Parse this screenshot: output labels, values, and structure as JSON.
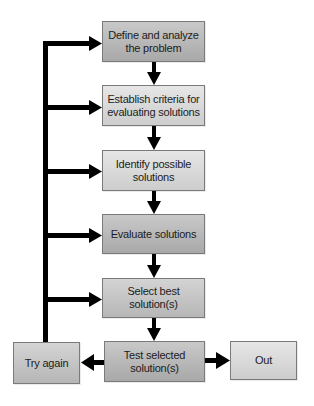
{
  "diagram": {
    "type": "flowchart",
    "title": "",
    "steps": [
      {
        "id": "define",
        "label": "Define and analyze the problem",
        "line1": "Define and analyze",
        "line2": "the problem"
      },
      {
        "id": "criteria",
        "label": "Establish criteria for evaluating solutions",
        "line1": "Establish criteria for",
        "line2": "evaluating solutions"
      },
      {
        "id": "identify",
        "label": "Identify possible solutions",
        "line1": "Identify possible",
        "line2": "solutions"
      },
      {
        "id": "evaluate",
        "label": "Evaluate solutions",
        "line1": "Evaluate solutions",
        "line2": ""
      },
      {
        "id": "select",
        "label": "Select best solution(s)",
        "line1": "Select best",
        "line2": "solution(s)"
      },
      {
        "id": "test",
        "label": "Test selected solution(s)",
        "line1": "Test selected",
        "line2": "solution(s)"
      }
    ],
    "branches": {
      "retry": {
        "id": "try-again",
        "label": "Try again"
      },
      "exit": {
        "id": "out",
        "label": "Out"
      }
    },
    "edges": [
      {
        "from": "define",
        "to": "criteria"
      },
      {
        "from": "criteria",
        "to": "identify"
      },
      {
        "from": "identify",
        "to": "evaluate"
      },
      {
        "from": "evaluate",
        "to": "select"
      },
      {
        "from": "select",
        "to": "test"
      },
      {
        "from": "test",
        "to": "try-again"
      },
      {
        "from": "test",
        "to": "out"
      },
      {
        "from": "try-again",
        "to": "define"
      },
      {
        "from": "try-again",
        "to": "criteria"
      },
      {
        "from": "try-again",
        "to": "identify"
      },
      {
        "from": "try-again",
        "to": "evaluate"
      },
      {
        "from": "try-again",
        "to": "select"
      }
    ],
    "colors": {
      "arrow": "#000000",
      "box_border": "#7a7a7a",
      "box_fill_dark": "#b4b4b4",
      "box_fill_light": "#d8d8d8",
      "text": "#1c1c1c"
    }
  }
}
